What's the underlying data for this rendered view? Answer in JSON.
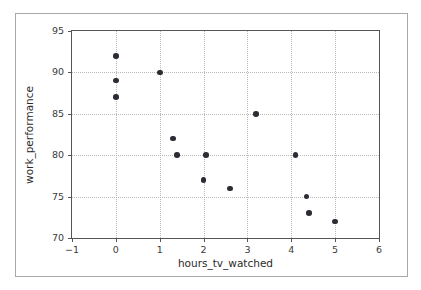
{
  "chart_data": {
    "type": "scatter",
    "title": "",
    "xlabel": "hours_tv_watched",
    "ylabel": "work_performance",
    "xlim": [
      -1,
      6
    ],
    "ylim": [
      70,
      95
    ],
    "xticks": [
      -1,
      0,
      1,
      2,
      3,
      4,
      5,
      6
    ],
    "xticklabels": [
      "−1",
      "0",
      "1",
      "2",
      "3",
      "4",
      "5",
      "6"
    ],
    "yticks": [
      70,
      75,
      80,
      85,
      90,
      95
    ],
    "yticklabels": [
      "70",
      "75",
      "80",
      "85",
      "90",
      "95"
    ],
    "grid": true,
    "grid_style": "dotted",
    "legend": null,
    "marker": {
      "shape": "circle",
      "color": "#2c2c34",
      "size": 5.6
    },
    "x": [
      0,
      0,
      0,
      1,
      1.3,
      1.4,
      2.0,
      2.05,
      2.6,
      3.2,
      4.1,
      4.35,
      4.4,
      5.0
    ],
    "y": [
      92,
      89,
      87,
      90,
      82,
      80,
      77,
      80,
      76,
      85,
      80,
      75,
      73,
      72
    ],
    "points": [
      {
        "x": 0,
        "y": 92
      },
      {
        "x": 0,
        "y": 89
      },
      {
        "x": 0,
        "y": 87
      },
      {
        "x": 1,
        "y": 90
      },
      {
        "x": 1.3,
        "y": 82
      },
      {
        "x": 1.4,
        "y": 80
      },
      {
        "x": 2.05,
        "y": 80
      },
      {
        "x": 2.0,
        "y": 77
      },
      {
        "x": 2.6,
        "y": 76
      },
      {
        "x": 3.2,
        "y": 85
      },
      {
        "x": 4.1,
        "y": 80
      },
      {
        "x": 4.35,
        "y": 75
      },
      {
        "x": 4.4,
        "y": 73
      },
      {
        "x": 5.0,
        "y": 72
      }
    ]
  },
  "colors": {
    "marker": "#2c2c34",
    "axis": "#555555",
    "grid": "#b9b9b9",
    "frame": "#a8a8a8",
    "text": "#2b2b2b",
    "background": "#ffffff"
  }
}
